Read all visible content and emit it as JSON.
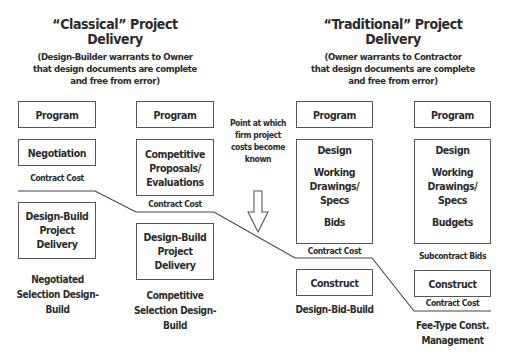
{
  "left_section": {
    "title_line1": "“Classical” Project",
    "title_line2": "Delivery",
    "subtitle_line1": "(Design-Builder warrants to Owner",
    "subtitle_line2": "that design documents are complete",
    "subtitle_line3": "and free from error)",
    "negotiated_column": {
      "program": "Program",
      "negotiation": "Negotiation",
      "cost_label": "Contract Cost",
      "delivery_line1": "Design-Build",
      "delivery_line2": "Project Delivery",
      "caption_line1": "Negotiated",
      "caption_line2": "Selection Design-",
      "caption_line3": "Build"
    },
    "competitive_column": {
      "program": "Program",
      "proposals_line1": "Competitive",
      "proposals_line2": "Proposals/",
      "proposals_line3": "Evaluations",
      "cost_label": "Contract Cost",
      "delivery_line1": "Design-Build",
      "delivery_line2": "Project Delivery",
      "caption_line1": "Competitive",
      "caption_line2": "Selection Design-",
      "caption_line3": "Build"
    }
  },
  "middle_note": {
    "line1": "Point at which",
    "line2": "firm project",
    "line3": "costs become",
    "line4": "known",
    "arrow": "down-arrow-icon"
  },
  "right_section": {
    "title_line1": "“Traditional” Project",
    "title_line2": "Delivery",
    "subtitle_line1": "(Owner warrants to Contractor",
    "subtitle_line2": "that design documents are complete",
    "subtitle_line3": "and free from error)",
    "dbb_column": {
      "program": "Program",
      "design": "Design",
      "working_line1": "Working",
      "working_line2": "Drawings/",
      "working_line3": "Specs",
      "final_step": "Bids",
      "cost_label": "Contract Cost",
      "construct": "Construct",
      "caption": "Design-Bid-Build"
    },
    "cm_column": {
      "program": "Program",
      "design": "Design",
      "working_line1": "Working",
      "working_line2": "Drawings/",
      "working_line3": "Specs",
      "final_step": "Budgets",
      "bids_label": "Subcontract Bids",
      "construct": "Construct",
      "cost_label": "Contract Cost",
      "caption_line1": "Fee-Type Const.",
      "caption_line2": "Management"
    }
  },
  "colors": {
    "text": "#2b2b2b",
    "border": "#555555",
    "line": "#444444",
    "background": "#ffffff"
  }
}
